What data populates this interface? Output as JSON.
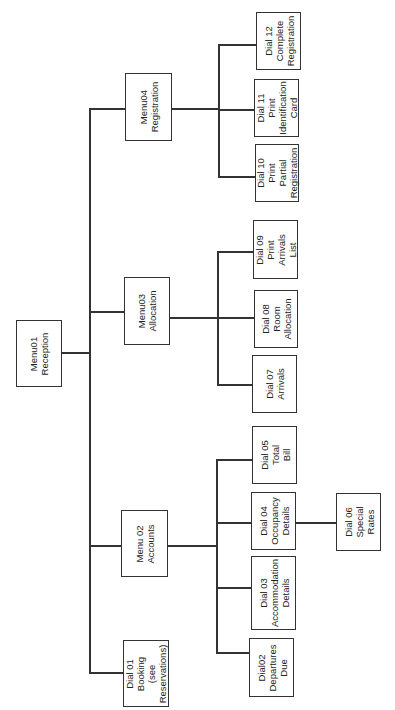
{
  "diagram": {
    "type": "hierarchy-chart",
    "orientation": "rotated-90-ccw",
    "root": {
      "id": "menu01",
      "lines": [
        "Menu01",
        "Reception"
      ]
    },
    "nodes": {
      "menu04": {
        "lines": [
          "Menu04",
          "Registration"
        ]
      },
      "menu03": {
        "lines": [
          "Menu03",
          "Allocation"
        ]
      },
      "menu02": {
        "lines": [
          "Menu 02",
          "Accounts"
        ]
      },
      "dial01": {
        "lines": [
          "Dial 01",
          "Booking",
          "(see",
          "Reservations)"
        ]
      },
      "dial12": {
        "lines": [
          "Dial 12",
          "Complete",
          "Registration"
        ]
      },
      "dial11": {
        "lines": [
          "Dial 11",
          "Print",
          "Identification",
          "Card"
        ]
      },
      "dial10": {
        "lines": [
          "Dial 10",
          "Print",
          "Partial",
          "Registration"
        ]
      },
      "dial09": {
        "lines": [
          "Dial 09",
          "Print",
          "Arrivals",
          "List"
        ]
      },
      "dial08": {
        "lines": [
          "Dial 08",
          "Room",
          "Allocation"
        ]
      },
      "dial07": {
        "lines": [
          "Dial 07",
          "Arrivals"
        ]
      },
      "dial05": {
        "lines": [
          "Dial 05",
          "Total",
          "Bill"
        ]
      },
      "dial04": {
        "lines": [
          "Dial 04",
          "Occupancy",
          "Details"
        ]
      },
      "dial06": {
        "lines": [
          "Dial 06",
          "Special",
          "Rates"
        ]
      },
      "dial03": {
        "lines": [
          "Dial 03",
          "Accommodation",
          "Details"
        ]
      },
      "dial02": {
        "lines": [
          "Dial02",
          "Departures",
          "Due"
        ]
      }
    },
    "edges": [
      [
        "menu01",
        "menu04"
      ],
      [
        "menu01",
        "menu03"
      ],
      [
        "menu01",
        "menu02"
      ],
      [
        "menu01",
        "dial01"
      ],
      [
        "menu04",
        "dial12"
      ],
      [
        "menu04",
        "dial11"
      ],
      [
        "menu04",
        "dial10"
      ],
      [
        "menu03",
        "dial09"
      ],
      [
        "menu03",
        "dial08"
      ],
      [
        "menu03",
        "dial07"
      ],
      [
        "menu02",
        "dial05"
      ],
      [
        "menu02",
        "dial04"
      ],
      [
        "menu02",
        "dial03"
      ],
      [
        "menu02",
        "dial02"
      ],
      [
        "dial04",
        "dial06"
      ]
    ]
  }
}
